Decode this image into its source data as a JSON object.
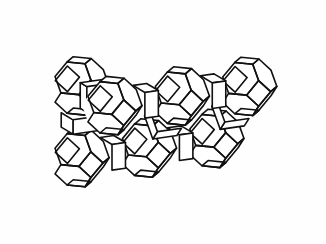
{
  "figure": {
    "subtitle": "Truncated octahedra (sodalite beta-cages) linked by double four-ring prisms",
    "structure_type": "LTA",
    "render_style": "line-art wireframe",
    "background_color": "#fefefe",
    "line_color": "#111111",
    "face_color": "#ffffff",
    "line_width": 1.6,
    "canvas": {
      "width": 326,
      "height": 244
    }
  },
  "geometry": {
    "polyhedron": {
      "name": "truncated-octahedron",
      "vertices": 24,
      "edges": 36,
      "square_faces": 6,
      "hexagonal_faces": 8,
      "circumradius": 30.0
    },
    "linker": {
      "name": "double-four-ring-prism",
      "shape": "square-prism",
      "faces": 6,
      "length": 15.0
    },
    "projection": {
      "type": "axonometric",
      "yaw_degrees": 26,
      "pitch_degrees": 17,
      "scale": 1.0,
      "origin_x": 163,
      "origin_y": 122
    },
    "lattice": {
      "spacing": 75.0,
      "description": "cage centers on a cubic lattice, projected",
      "cage_centers": [
        {
          "id": "cage-top-left",
          "i": 0,
          "j": 1,
          "k": 1
        },
        {
          "id": "cage-top-mid",
          "i": 1,
          "j": 1,
          "k": 1
        },
        {
          "id": "cage-top-right",
          "i": 2,
          "j": 1,
          "k": 1
        },
        {
          "id": "cage-mid-left",
          "i": 0,
          "j": 1,
          "k": 0
        },
        {
          "id": "cage-bottom-left",
          "i": 0,
          "j": 0,
          "k": 0
        },
        {
          "id": "cage-bottom-mid",
          "i": 1,
          "j": 0,
          "k": 0
        },
        {
          "id": "cage-bottom-right",
          "i": 2,
          "j": 0,
          "k": 0
        }
      ],
      "linker_bonds": [
        {
          "from": "cage-top-left",
          "to": "cage-top-mid"
        },
        {
          "from": "cage-top-mid",
          "to": "cage-top-right"
        },
        {
          "from": "cage-bottom-left",
          "to": "cage-bottom-mid"
        },
        {
          "from": "cage-bottom-mid",
          "to": "cage-bottom-right"
        },
        {
          "from": "cage-top-left",
          "to": "cage-mid-left"
        },
        {
          "from": "cage-mid-left",
          "to": "cage-bottom-left"
        },
        {
          "from": "cage-top-mid",
          "to": "cage-bottom-mid"
        },
        {
          "from": "cage-top-right",
          "to": "cage-bottom-right"
        }
      ]
    }
  }
}
